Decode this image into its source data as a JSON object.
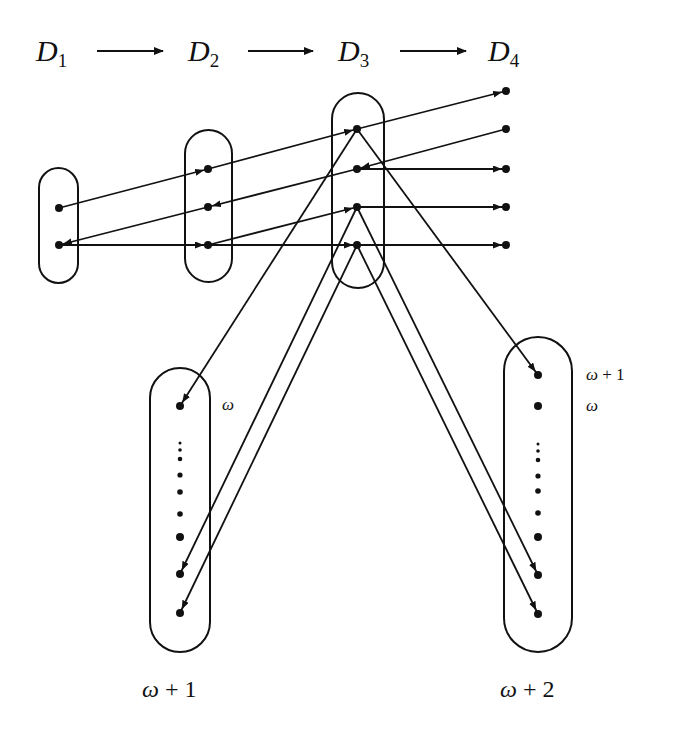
{
  "diagram": {
    "stages": [
      {
        "id": "D1",
        "letter": "D",
        "sub": "1",
        "label_x": 36
      },
      {
        "id": "D2",
        "letter": "D",
        "sub": "2",
        "label_x": 188
      },
      {
        "id": "D3",
        "letter": "D",
        "sub": "3",
        "label_x": 338
      },
      {
        "id": "D4",
        "letter": "D",
        "sub": "4",
        "label_x": 488
      }
    ],
    "stage_arrows": [
      {
        "from": "D1",
        "to": "D2"
      },
      {
        "from": "D2",
        "to": "D3"
      },
      {
        "from": "D3",
        "to": "D4"
      }
    ],
    "left_set": {
      "bottom_label_omega": "ω",
      "bottom_label_rest": " + 1",
      "side_label": "ω"
    },
    "right_set": {
      "bottom_label_omega": "ω",
      "bottom_label_rest": " + 2",
      "side_label_top_omega": "ω",
      "side_label_top_rest": " + 1",
      "side_label_second": "ω"
    },
    "colors": {
      "ink": "#111111",
      "background": "#ffffff"
    }
  }
}
